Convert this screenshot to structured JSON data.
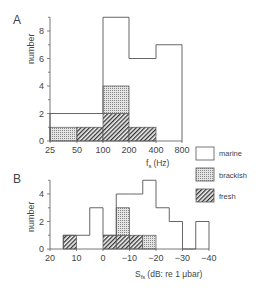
{
  "chart_data": [
    {
      "panel": "A",
      "type": "bar",
      "stacked": true,
      "xlabel": "f_s (Hz)",
      "xlabel_main": "f",
      "xlabel_sub": "s",
      "xlabel_unit": "(Hz)",
      "ylabel": "number",
      "x_scale": "log2",
      "x_ticks": [
        "25",
        "50",
        "100",
        "200",
        "400",
        "800"
      ],
      "y_ticks": [
        "0",
        "2",
        "4",
        "6",
        "8"
      ],
      "ylim": [
        0,
        9
      ],
      "bins": [
        {
          "from": "25",
          "to": "50",
          "fresh": 0,
          "brackish": 1,
          "marine": 1,
          "total": 2
        },
        {
          "from": "50",
          "to": "100",
          "fresh": 1,
          "brackish": 0,
          "marine": 1,
          "total": 2
        },
        {
          "from": "100",
          "to": "200",
          "fresh": 2,
          "brackish": 2,
          "marine": 5,
          "total": 9
        },
        {
          "from": "200",
          "to": "400",
          "fresh": 1,
          "brackish": 0,
          "marine": 5,
          "total": 6
        },
        {
          "from": "400",
          "to": "800",
          "fresh": 0,
          "brackish": 0,
          "marine": 7,
          "total": 7
        }
      ]
    },
    {
      "panel": "B",
      "type": "bar",
      "stacked": true,
      "xlabel": "S_fs (dB: re 1 μbar)",
      "xlabel_main": "S",
      "xlabel_sub": "fs",
      "xlabel_unit": "(dB: re 1 μbar)",
      "ylabel": "number",
      "x_ticks": [
        "20",
        "10",
        "0",
        "−10",
        "−20",
        "−30",
        "−40"
      ],
      "y_ticks": [
        "0",
        "2",
        "4"
      ],
      "ylim": [
        0,
        5
      ],
      "xlim": [
        20,
        -40
      ],
      "bins": [
        {
          "from": 15,
          "to": 10,
          "fresh": 1,
          "brackish": 0,
          "marine": 0,
          "total": 1
        },
        {
          "from": 10,
          "to": 5,
          "fresh": 0,
          "brackish": 0,
          "marine": 1,
          "total": 1
        },
        {
          "from": 5,
          "to": 0,
          "fresh": 0,
          "brackish": 0,
          "marine": 3,
          "total": 3
        },
        {
          "from": 0,
          "to": -5,
          "fresh": 1,
          "brackish": 0,
          "marine": 0,
          "total": 1
        },
        {
          "from": -5,
          "to": -10,
          "fresh": 1,
          "brackish": 2,
          "marine": 1,
          "total": 4
        },
        {
          "from": -10,
          "to": -15,
          "fresh": 1,
          "brackish": 0,
          "marine": 3,
          "total": 4
        },
        {
          "from": -15,
          "to": -20,
          "fresh": 0,
          "brackish": 1,
          "marine": 4,
          "total": 5
        },
        {
          "from": -20,
          "to": -25,
          "fresh": 0,
          "brackish": 0,
          "marine": 3,
          "total": 3
        },
        {
          "from": -25,
          "to": -30,
          "fresh": 0,
          "brackish": 0,
          "marine": 2,
          "total": 2
        },
        {
          "from": -30,
          "to": -35,
          "fresh": 0,
          "brackish": 0,
          "marine": 0,
          "total": 0
        },
        {
          "from": -35,
          "to": -40,
          "fresh": 0,
          "brackish": 0,
          "marine": 2,
          "total": 2
        }
      ]
    }
  ],
  "legend": [
    {
      "key": "marine",
      "label": "marine",
      "pattern": "none"
    },
    {
      "key": "brackish",
      "label": "brackish",
      "pattern": "dots"
    },
    {
      "key": "fresh",
      "label": "fresh",
      "pattern": "hatch"
    }
  ],
  "panel_labels": {
    "a": "A",
    "b": "B"
  },
  "colors": {
    "line": "#555555",
    "bg": "#ffffff",
    "dots": "#777777",
    "hatch": "#444444"
  }
}
